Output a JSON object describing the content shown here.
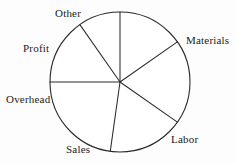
{
  "chart_data": {
    "type": "pie",
    "title": "",
    "subtitle": "",
    "xlabel": "",
    "ylabel": "",
    "grid": false,
    "legend_position": "none",
    "labels_position": "outside",
    "center": {
      "x": 120,
      "y": 82
    },
    "radius": 70,
    "units": "degrees",
    "categories": [
      "Materials",
      "Labor",
      "Sales",
      "Overhead",
      "Profit",
      "Other"
    ],
    "values": [
      55,
      70,
      63,
      82,
      55,
      35
    ],
    "percentages": [
      15.3,
      19.4,
      17.5,
      22.8,
      15.3,
      9.7
    ],
    "slices": [
      {
        "label": "Materials",
        "start_angle": 0,
        "end_angle": 55,
        "sweep": 55,
        "percent": 15.3,
        "label_x": 186,
        "label_y": 35
      },
      {
        "label": "Labor",
        "start_angle": 55,
        "end_angle": 125,
        "sweep": 70,
        "percent": 19.4,
        "label_x": 171,
        "label_y": 134
      },
      {
        "label": "Sales",
        "start_angle": 125,
        "end_angle": 188,
        "sweep": 63,
        "percent": 17.5,
        "label_x": 66,
        "label_y": 144
      },
      {
        "label": "Overhead",
        "start_angle": 188,
        "end_angle": 270,
        "sweep": 82,
        "percent": 22.8,
        "label_x": 6,
        "label_y": 94
      },
      {
        "label": "Profit",
        "start_angle": 270,
        "end_angle": 325,
        "sweep": 55,
        "percent": 15.3,
        "label_x": 23,
        "label_y": 43
      },
      {
        "label": "Other",
        "start_angle": 325,
        "end_angle": 360,
        "sweep": 35,
        "percent": 9.7,
        "label_x": 55,
        "label_y": 8
      }
    ],
    "colors": {
      "stroke": "#2b2b2b",
      "fill": "#ffffff",
      "background": "#fdfdfd",
      "text": "#1c1c1c"
    }
  }
}
